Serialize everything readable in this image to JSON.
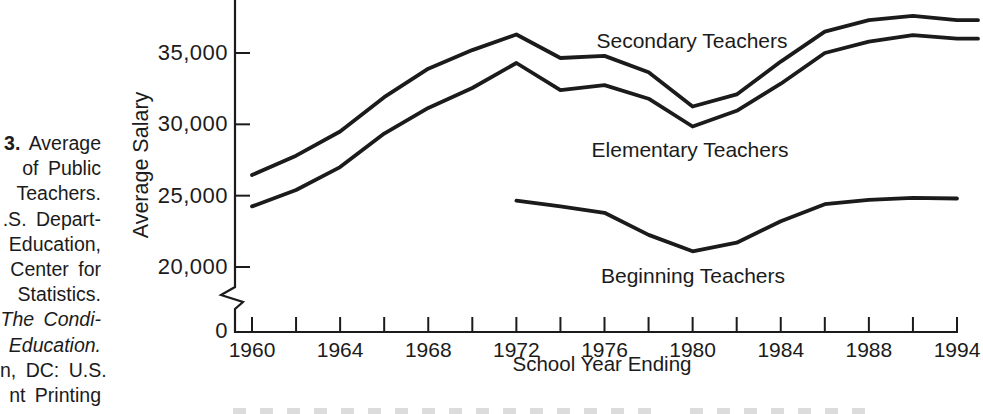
{
  "figure_caption": {
    "cropped": "left edge of page cut off",
    "lines": [
      {
        "text": "3. Average",
        "bold_prefix": "3."
      },
      {
        "text": "of Public"
      },
      {
        "text": "Teachers."
      },
      {
        "text": ".S. Depart-"
      },
      {
        "text": "Education,"
      },
      {
        "text": "Center for"
      },
      {
        "text": "Statistics."
      },
      {
        "text": "The Condi-",
        "italic": true
      },
      {
        "text": "Education.",
        "italic": true
      },
      {
        "text": "n, DC: U.S."
      },
      {
        "text": "nt Printing"
      }
    ]
  },
  "chart_data": {
    "type": "line",
    "title": "",
    "xlabel": "School Year Ending",
    "ylabel": "Average Salary",
    "line_color": "#1b1b1b",
    "y_ticks": [
      {
        "label": "35,000",
        "value": 35000
      },
      {
        "label": "30,000",
        "value": 30000
      },
      {
        "label": "25,000",
        "value": 25000
      },
      {
        "label": "20,000",
        "value": 20000
      },
      {
        "label": "0",
        "value": 0,
        "below_axis_break": true
      }
    ],
    "axis_break": true,
    "x_tick_count": 17,
    "x_ticks_every_years": 2,
    "x_tick_labels": [
      "1960",
      "1964",
      "1968",
      "1972",
      "1976",
      "1980",
      "1984",
      "1988",
      "1994"
    ],
    "ylim_shown": [
      20000,
      38500
    ],
    "grid": false,
    "legend": "inline labels next to curves",
    "series": [
      {
        "name": "Secondary Teachers",
        "start_tick": 0,
        "extend_px": 21,
        "values": [
          26450,
          27800,
          29500,
          31900,
          33900,
          35200,
          36300,
          34650,
          34800,
          33650,
          31250,
          32100,
          34400,
          36500,
          37300,
          37600,
          37300
        ]
      },
      {
        "name": "Elementary Teachers",
        "start_tick": 0,
        "extend_px": 21,
        "values": [
          24250,
          25400,
          27000,
          29350,
          31150,
          32550,
          34300,
          32400,
          32750,
          31800,
          29850,
          30950,
          32850,
          35000,
          35800,
          36250,
          36000
        ]
      },
      {
        "name": "Beginning Teachers",
        "start_tick": 6,
        "extend_px": 0,
        "values": [
          24650,
          24250,
          23800,
          22250,
          21100,
          21700,
          23200,
          24400,
          24700,
          24850,
          24800
        ]
      }
    ]
  }
}
